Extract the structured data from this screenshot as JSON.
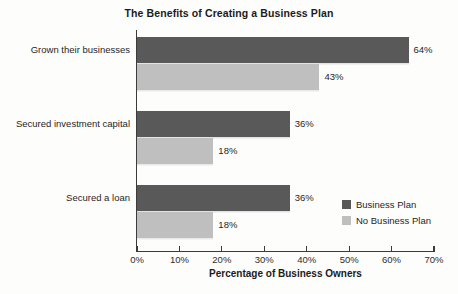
{
  "chart_data": {
    "type": "bar",
    "orientation": "horizontal",
    "title": "The Benefits of Creating a Business Plan",
    "xlabel": "Percentage of Business Owners",
    "ylabel": "",
    "xlim": [
      0,
      70
    ],
    "grid": false,
    "legend_position": "inside-lower-right",
    "categories": [
      "Grown their businesses",
      "Secured investment capital",
      "Secured a loan"
    ],
    "tick_labels": [
      "0%",
      "10%",
      "20%",
      "30%",
      "40%",
      "50%",
      "60%",
      "70%"
    ],
    "tick_values": [
      0,
      10,
      20,
      30,
      40,
      50,
      60,
      70
    ],
    "series": [
      {
        "name": "Business Plan",
        "color": "#595959",
        "values": [
          64,
          36,
          36
        ],
        "data_labels": [
          "64%",
          "36%",
          "36%"
        ]
      },
      {
        "name": "No Business Plan",
        "color": "#bfbfbf",
        "values": [
          43,
          18,
          18
        ],
        "data_labels": [
          "43%",
          "18%",
          "18%"
        ]
      }
    ]
  }
}
